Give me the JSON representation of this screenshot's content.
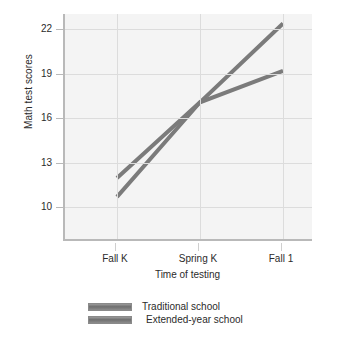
{
  "chart_data": {
    "type": "line",
    "title": "",
    "subtitle": "",
    "xlabel": "Time of testing",
    "ylabel": "Math test scores",
    "categories": [
      "Fall K",
      "Spring K",
      "Fall 1"
    ],
    "x": [
      0,
      1,
      2
    ],
    "yticks": [
      10,
      13,
      16,
      19,
      22
    ],
    "ylim": [
      8.2,
      22.6
    ],
    "xlim": [
      -0.35,
      2.25
    ],
    "grid": true,
    "legend_position": "below-center",
    "series": [
      {
        "name": "Traditional school",
        "values": [
          12.2,
          17.0,
          19.0
        ],
        "color": "#7b7b7b"
      },
      {
        "name": "Extended-year school",
        "values": [
          11.0,
          17.0,
          22.0
        ],
        "color": "#7b7b7b"
      }
    ],
    "annotations": []
  },
  "axes": {
    "y_title": "Math test scores",
    "x_title": "Time of testing",
    "y_tick_labels": [
      "22",
      "19",
      "16",
      "13",
      "10"
    ],
    "x_tick_labels": [
      "Fall K",
      "Spring K",
      "Fall 1"
    ]
  },
  "legend": {
    "items": [
      {
        "label": "Traditional school",
        "swatch": "gray-bar-swatch"
      },
      {
        "label": "Extended-year school",
        "swatch": "gray-bar-swatch"
      }
    ]
  },
  "colors": {
    "line": "#7b7b7b",
    "plot_background": "#f4f4f4",
    "gridline": "#dcdcdc",
    "axis": "#b9b9b9",
    "text": "#2b2b2b",
    "page_background": "#ffffff"
  }
}
